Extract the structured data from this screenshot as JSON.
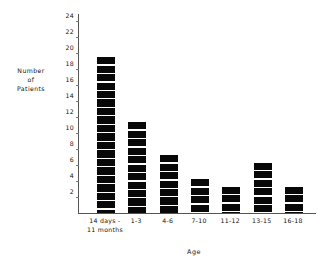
{
  "chart_data": {
    "type": "bar",
    "title": "",
    "xlabel": "Age",
    "ylabel": "Number of Patients",
    "ylabel_lines": [
      "Number",
      "of",
      "Patients"
    ],
    "categories": [
      "14 days -\n11 months",
      "1-3",
      "4-6",
      "7-10",
      "11-12",
      "13-15",
      "16-18"
    ],
    "category_lines": [
      [
        "14 days -",
        "11 months"
      ],
      [
        "1-3",
        ""
      ],
      [
        "4-6",
        ""
      ],
      [
        "7-10",
        ""
      ],
      [
        "11-12",
        ""
      ],
      [
        "13-15",
        ""
      ],
      [
        "16-18",
        ""
      ]
    ],
    "values": [
      19.5,
      11.4,
      7.2,
      4.3,
      3.3,
      6.3,
      3.3
    ],
    "ylim": [
      0,
      25
    ],
    "yticks": [
      2,
      4,
      6,
      8,
      10,
      12,
      14,
      16,
      18,
      20,
      22,
      24
    ],
    "grid": false,
    "legend": null,
    "bar_color": "#080808",
    "axis_color": "#555555",
    "background": "#ffffff"
  },
  "axis": {
    "y_label_line1": "Number",
    "y_label_line2": "of",
    "y_label_line3": "Patients",
    "x_title": "Age"
  }
}
